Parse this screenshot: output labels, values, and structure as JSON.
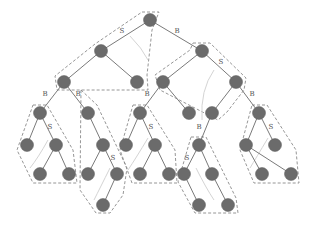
{
  "diagram": {
    "colors": {
      "node": "#6b6b6b",
      "edge": "#7a7a7a",
      "region": "#8a8a8a",
      "arc": "#d4d4d4",
      "label": "#555555"
    },
    "nodes": [
      {
        "id": "n0",
        "x": 150,
        "y": 20
      },
      {
        "id": "n1",
        "x": 101,
        "y": 51
      },
      {
        "id": "n2",
        "x": 202,
        "y": 51
      },
      {
        "id": "n3",
        "x": 64,
        "y": 82
      },
      {
        "id": "n4",
        "x": 137,
        "y": 82
      },
      {
        "id": "n5",
        "x": 163,
        "y": 82
      },
      {
        "id": "n6",
        "x": 236,
        "y": 82
      },
      {
        "id": "n7",
        "x": 40,
        "y": 113
      },
      {
        "id": "n8",
        "x": 88,
        "y": 113
      },
      {
        "id": "n9",
        "x": 140,
        "y": 113
      },
      {
        "id": "n10",
        "x": 189,
        "y": 113
      },
      {
        "id": "n11",
        "x": 212,
        "y": 113
      },
      {
        "id": "n12",
        "x": 259,
        "y": 113
      },
      {
        "id": "n13",
        "x": 27,
        "y": 145
      },
      {
        "id": "n14",
        "x": 56,
        "y": 145
      },
      {
        "id": "n15",
        "x": 103,
        "y": 145
      },
      {
        "id": "n16",
        "x": 126,
        "y": 145
      },
      {
        "id": "n17",
        "x": 155,
        "y": 145
      },
      {
        "id": "n18",
        "x": 199,
        "y": 145
      },
      {
        "id": "n19",
        "x": 246,
        "y": 145
      },
      {
        "id": "n20",
        "x": 275,
        "y": 145
      },
      {
        "id": "n21",
        "x": 40,
        "y": 174
      },
      {
        "id": "n22",
        "x": 69,
        "y": 174
      },
      {
        "id": "n23",
        "x": 88,
        "y": 174
      },
      {
        "id": "n24",
        "x": 117,
        "y": 174
      },
      {
        "id": "n25",
        "x": 140,
        "y": 174
      },
      {
        "id": "n26",
        "x": 169,
        "y": 174
      },
      {
        "id": "n27",
        "x": 184,
        "y": 174
      },
      {
        "id": "n28",
        "x": 212,
        "y": 174
      },
      {
        "id": "n29",
        "x": 262,
        "y": 174
      },
      {
        "id": "n30",
        "x": 291,
        "y": 174
      },
      {
        "id": "n31",
        "x": 103,
        "y": 205
      },
      {
        "id": "n32",
        "x": 199,
        "y": 205
      },
      {
        "id": "n33",
        "x": 228,
        "y": 205
      }
    ],
    "edges": [
      [
        "n0",
        "n1"
      ],
      [
        "n0",
        "n2"
      ],
      [
        "n1",
        "n3"
      ],
      [
        "n1",
        "n4"
      ],
      [
        "n2",
        "n5"
      ],
      [
        "n2",
        "n6"
      ],
      [
        "n3",
        "n7"
      ],
      [
        "n3",
        "n8"
      ],
      [
        "n5",
        "n9"
      ],
      [
        "n5",
        "n10"
      ],
      [
        "n6",
        "n11"
      ],
      [
        "n6",
        "n12"
      ],
      [
        "n7",
        "n13"
      ],
      [
        "n7",
        "n14"
      ],
      [
        "n8",
        "n15"
      ],
      [
        "n9",
        "n16"
      ],
      [
        "n9",
        "n17"
      ],
      [
        "n11",
        "n18"
      ],
      [
        "n12",
        "n19"
      ],
      [
        "n12",
        "n20"
      ],
      [
        "n14",
        "n21"
      ],
      [
        "n14",
        "n22"
      ],
      [
        "n15",
        "n23"
      ],
      [
        "n15",
        "n24"
      ],
      [
        "n17",
        "n25"
      ],
      [
        "n17",
        "n26"
      ],
      [
        "n18",
        "n27"
      ],
      [
        "n18",
        "n28"
      ],
      [
        "n19",
        "n29"
      ],
      [
        "n19",
        "n30"
      ],
      [
        "n24",
        "n31"
      ],
      [
        "n27",
        "n32"
      ],
      [
        "n28",
        "n33"
      ]
    ],
    "edge_labels": [
      {
        "text": "S",
        "x": 122,
        "y": 33
      },
      {
        "text": "B",
        "x": 177,
        "y": 33
      },
      {
        "text": "S",
        "x": 221,
        "y": 64
      },
      {
        "text": "B",
        "x": 45,
        "y": 96
      },
      {
        "text": "B",
        "x": 78,
        "y": 96
      },
      {
        "text": "B",
        "x": 147,
        "y": 96
      },
      {
        "text": "B",
        "x": 252,
        "y": 96
      },
      {
        "text": "S",
        "x": 50,
        "y": 129
      },
      {
        "text": "S",
        "x": 151,
        "y": 129
      },
      {
        "text": "B",
        "x": 199,
        "y": 129
      },
      {
        "text": "S",
        "x": 271,
        "y": 129
      },
      {
        "text": "S",
        "x": 113,
        "y": 160
      },
      {
        "text": "S",
        "x": 187,
        "y": 160
      }
    ]
  }
}
